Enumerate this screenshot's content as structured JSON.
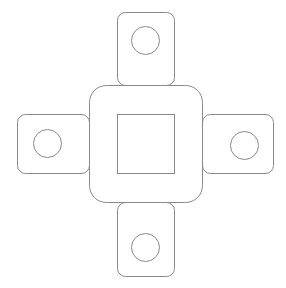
{
  "diagram": {
    "line_color": "#8a8a8a",
    "background": "#ffffff",
    "center_body": {
      "outer": {
        "x": 89,
        "y": 85,
        "w": 113,
        "h": 117,
        "rx": 17
      },
      "inner_square": {
        "x": 117,
        "y": 114,
        "w": 57,
        "h": 59
      }
    },
    "tabs": [
      {
        "name": "top",
        "x": 117,
        "y": 12,
        "w": 57,
        "h": 73,
        "rx": 8,
        "hole": {
          "cx": 145,
          "cy": 40,
          "r": 14
        }
      },
      {
        "name": "bottom",
        "x": 117,
        "y": 202,
        "w": 57,
        "h": 74,
        "rx": 8,
        "hole": {
          "cx": 145,
          "cy": 247,
          "r": 14
        }
      },
      {
        "name": "left",
        "x": 17,
        "y": 114,
        "w": 72,
        "h": 59,
        "rx": 8,
        "hole": {
          "cx": 47,
          "cy": 143,
          "r": 14
        }
      },
      {
        "name": "right",
        "x": 202,
        "y": 114,
        "w": 71,
        "h": 59,
        "rx": 8,
        "hole": {
          "cx": 244,
          "cy": 145,
          "r": 14
        }
      }
    ]
  }
}
